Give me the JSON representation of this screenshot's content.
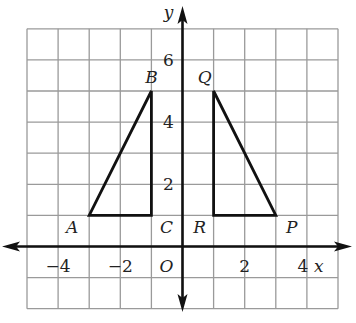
{
  "diagram": {
    "type": "coordinate-grid",
    "grid": {
      "x_min": -5,
      "x_max": 5,
      "y_min": -2,
      "y_max": 7,
      "step": 1
    },
    "axes": {
      "x_label": "x",
      "y_label": "y",
      "origin_label": "O"
    },
    "x_ticks": [
      {
        "value": -4,
        "label": "−4"
      },
      {
        "value": -2,
        "label": "−2"
      },
      {
        "value": 2,
        "label": "2"
      },
      {
        "value": 4,
        "label": "4"
      }
    ],
    "y_ticks": [
      {
        "value": 2,
        "label": "2"
      },
      {
        "value": 4,
        "label": "4"
      },
      {
        "value": 6,
        "label": "6"
      }
    ],
    "shapes": [
      {
        "name": "triangle-ABC",
        "vertices": [
          {
            "label": "A",
            "x": -3,
            "y": 1
          },
          {
            "label": "B",
            "x": -1,
            "y": 5
          },
          {
            "label": "C",
            "x": -1,
            "y": 1
          }
        ]
      },
      {
        "name": "triangle-PQR",
        "vertices": [
          {
            "label": "P",
            "x": 3,
            "y": 1
          },
          {
            "label": "Q",
            "x": 1,
            "y": 5
          },
          {
            "label": "R",
            "x": 1,
            "y": 1
          }
        ]
      }
    ],
    "colors": {
      "grid": "#9a9a9a",
      "axis": "#111111",
      "shape": "#111111"
    }
  }
}
